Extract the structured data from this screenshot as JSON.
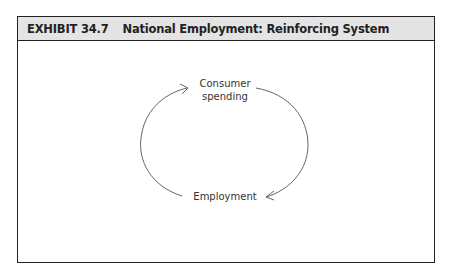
{
  "exhibit": {
    "number": "EXHIBIT 34.7",
    "title": "National Employment:  Reinforcing System"
  },
  "diagram": {
    "type": "reinforcing-loop",
    "nodes": [
      {
        "id": "consumer_spending",
        "label_line1": "Consumer",
        "label_line2": "spending"
      },
      {
        "id": "employment",
        "label": "Employment"
      }
    ],
    "edges": [
      {
        "from": "consumer_spending",
        "to": "employment",
        "side": "right"
      },
      {
        "from": "employment",
        "to": "consumer_spending",
        "side": "left"
      }
    ],
    "colors": {
      "line": "#666666",
      "header_bg": "#e4e4e4",
      "border": "#222222"
    }
  }
}
